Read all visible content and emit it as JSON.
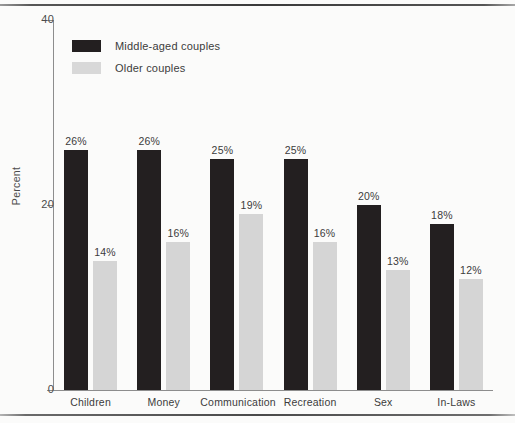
{
  "chart_data": {
    "type": "bar",
    "title": "",
    "subtitle": "",
    "xlabel": "",
    "ylabel": "Percent",
    "ylim": [
      0,
      40
    ],
    "yticks": [
      0,
      20,
      40
    ],
    "ytick_labels": [
      "0",
      "20",
      "40"
    ],
    "grid": false,
    "legend_position": "top-left",
    "value_label_suffix": "%",
    "categories": [
      "Children",
      "Money",
      "Communication",
      "Recreation",
      "Sex",
      "In-Laws"
    ],
    "series": [
      {
        "name": "Middle-aged couples",
        "color": "#231f20",
        "values": [
          26,
          26,
          25,
          25,
          20,
          18
        ],
        "value_labels": [
          "26%",
          "26%",
          "25%",
          "25%",
          "20%",
          "18%"
        ]
      },
      {
        "name": "Older couples",
        "color": "#d5d5d5",
        "values": [
          14,
          16,
          19,
          16,
          13,
          12
        ],
        "value_labels": [
          "14%",
          "16%",
          "19%",
          "16%",
          "13%",
          "12%"
        ]
      }
    ]
  },
  "axis": {
    "y_title": "Percent",
    "ticks": [
      {
        "value": 40,
        "label": "40"
      },
      {
        "value": 20,
        "label": "20"
      },
      {
        "value": 0,
        "label": "0"
      }
    ]
  },
  "legend": {
    "items": [
      {
        "label": "Middle-aged couples",
        "swatch": "dark"
      },
      {
        "label": "Older couples",
        "swatch": "light"
      }
    ]
  },
  "colors": {
    "series_dark": "#231f20",
    "series_light": "#d5d5d5",
    "axis": "#8d8d8d",
    "text": "#3c3c3c",
    "background": "#fbfbfa"
  }
}
